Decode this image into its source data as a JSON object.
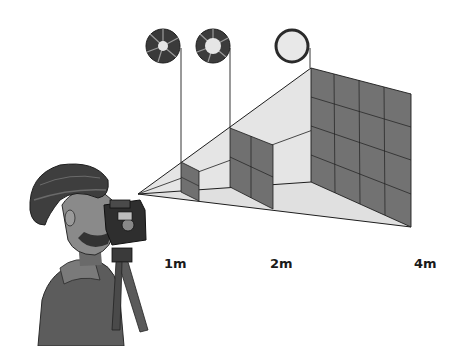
{
  "diagram": {
    "distances": [
      {
        "label": "1m",
        "x": 167,
        "y": 256,
        "aperture": "closed"
      },
      {
        "label": "2m",
        "x": 271,
        "y": 256,
        "aperture": "half-open"
      },
      {
        "label": "4m",
        "x": 417,
        "y": 256,
        "aperture": "open"
      }
    ],
    "colors": {
      "background": "#ffffff",
      "frustum_fill": "#e2e2e2",
      "plane_fill": "#6f6f6f",
      "line": "#1e1e1e",
      "aperture_dark": "#3a3a3a",
      "aperture_light": "#e6e6e6"
    }
  }
}
